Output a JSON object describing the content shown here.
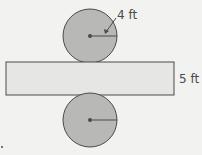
{
  "diagram": {
    "top_circle": {
      "cx": 90,
      "cy": 36,
      "r": 27,
      "label": "4 ft"
    },
    "rectangle": {
      "x": 6,
      "y": 62,
      "width": 168,
      "height": 33,
      "label": "5 ft"
    },
    "bottom_circle": {
      "cx": 90,
      "cy": 120,
      "r": 27
    },
    "colors": {
      "background": "#f2f2f0",
      "circle_fill": "#b8b8b6",
      "rect_fill": "#e6e6e4",
      "stroke": "#4a4a4a",
      "text": "#4a4a4a"
    }
  }
}
